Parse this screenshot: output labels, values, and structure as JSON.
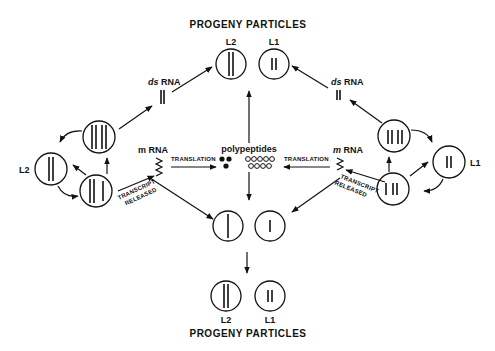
{
  "diagram": {
    "type": "virus replication cycle (L1 / L2 dsRNA segments)",
    "top_title": "PROGENY PARTICLES",
    "bottom_title": "PROGENY PARTICLES",
    "top_progeny": [
      {
        "label": "L2",
        "strands": "double-long"
      },
      {
        "label": "L1",
        "strands": "double-short"
      }
    ],
    "bottom_progeny": [
      {
        "label": "L2",
        "strands": "double-long"
      },
      {
        "label": "L1",
        "strands": "double-short"
      }
    ],
    "left_cycle": {
      "label": "L2",
      "ds_label_prefix": "ds",
      "ds_label_suffix": "RNA",
      "mrna_label": "m RNA",
      "transcript_label_1": "TRANSCRIPT",
      "transcript_label_2": "RELEASED",
      "translation_label": "TRANSLATION"
    },
    "right_cycle": {
      "label": "L1",
      "ds_label_prefix": "ds",
      "ds_label_suffix": "RNA",
      "mrna_label": "m RNA",
      "transcript_label_1": "TRANSCRIPT",
      "transcript_label_2": "RELEASED",
      "translation_label": "TRANSLATION"
    },
    "center": {
      "polypeptides_label": "polypeptides",
      "filled_dots": 3,
      "open_dots_row1": 5,
      "open_dots_row2": 4
    },
    "middle_particles": [
      {
        "strands": "single-long"
      },
      {
        "strands": "single-short"
      }
    ]
  }
}
